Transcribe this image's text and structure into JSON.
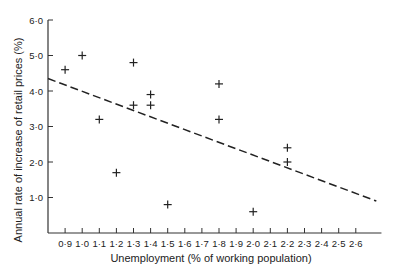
{
  "chart_data": {
    "type": "scatter",
    "title": "",
    "xlabel": "Unemployment (% of working population)",
    "ylabel": "Annual  rate of increase of retail prices (%)",
    "x_ticks": [
      "0·9",
      "1·0",
      "1·1",
      "1·2",
      "1·3",
      "1·4",
      "1·5",
      "1·6",
      "1·7",
      "1·8",
      "1·9",
      "2·0",
      "2·1",
      "2·2",
      "2·3",
      "2·4",
      "2·5",
      "2·6"
    ],
    "x_tick_values": [
      0.9,
      1.0,
      1.1,
      1.2,
      1.3,
      1.4,
      1.5,
      1.6,
      1.7,
      1.8,
      1.9,
      2.0,
      2.1,
      2.2,
      2.3,
      2.4,
      2.5,
      2.6
    ],
    "y_ticks": [
      "1·0",
      "2·0",
      "3·0",
      "4·0",
      "5·0",
      "6·0"
    ],
    "y_tick_values": [
      1.0,
      2.0,
      3.0,
      4.0,
      5.0,
      6.0
    ],
    "xlim": [
      0.8,
      2.75
    ],
    "ylim": [
      0,
      6.0
    ],
    "grid": false,
    "marker": "+",
    "points": [
      {
        "x": 0.9,
        "y": 4.6
      },
      {
        "x": 1.0,
        "y": 5.0
      },
      {
        "x": 1.1,
        "y": 3.2
      },
      {
        "x": 1.2,
        "y": 1.7
      },
      {
        "x": 1.3,
        "y": 4.8
      },
      {
        "x": 1.3,
        "y": 3.6
      },
      {
        "x": 1.4,
        "y": 3.9
      },
      {
        "x": 1.4,
        "y": 3.6
      },
      {
        "x": 1.5,
        "y": 0.8
      },
      {
        "x": 1.8,
        "y": 4.2
      },
      {
        "x": 1.8,
        "y": 3.2
      },
      {
        "x": 2.0,
        "y": 0.6
      },
      {
        "x": 2.2,
        "y": 2.4
      },
      {
        "x": 2.2,
        "y": 2.0
      }
    ],
    "trend_line": {
      "style": "dashed",
      "x": [
        0.8,
        2.72
      ],
      "y": [
        4.35,
        0.9
      ]
    }
  }
}
